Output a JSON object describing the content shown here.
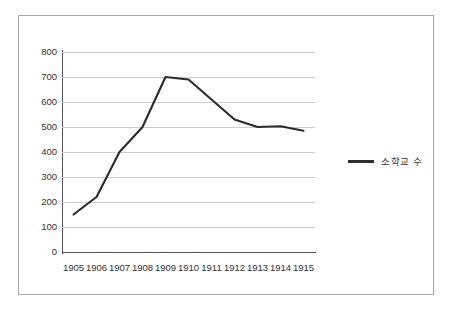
{
  "chart_data": {
    "type": "line",
    "title": "",
    "xlabel": "",
    "ylabel": "",
    "categories": [
      "1905",
      "1906",
      "1907",
      "1908",
      "1909",
      "1910",
      "1911",
      "1912",
      "1913",
      "1914",
      "1915"
    ],
    "series": [
      {
        "name": "소학교 수",
        "color": "#2b2b2b",
        "values": [
          150,
          220,
          400,
          500,
          700,
          690,
          610,
          530,
          500,
          503,
          485
        ]
      }
    ],
    "ylim": [
      0,
      800
    ],
    "ytick_values": [
      0,
      100,
      200,
      300,
      400,
      500,
      600,
      700,
      800
    ],
    "ytick_labels": [
      "0",
      "100",
      "200",
      "300",
      "400",
      "500",
      "600",
      "700",
      "800"
    ],
    "grid": "horizontal",
    "legend_position": "right",
    "legend_entries": [
      "소학교 수"
    ]
  },
  "legend": {
    "label": "소학교 수"
  },
  "colors": {
    "series_line": "#2b2b2b",
    "gridline": "#cfcfcf",
    "axis": "#555555",
    "frame": "#a8a8a8",
    "background": "#ffffff",
    "tick_text": "#333333"
  }
}
